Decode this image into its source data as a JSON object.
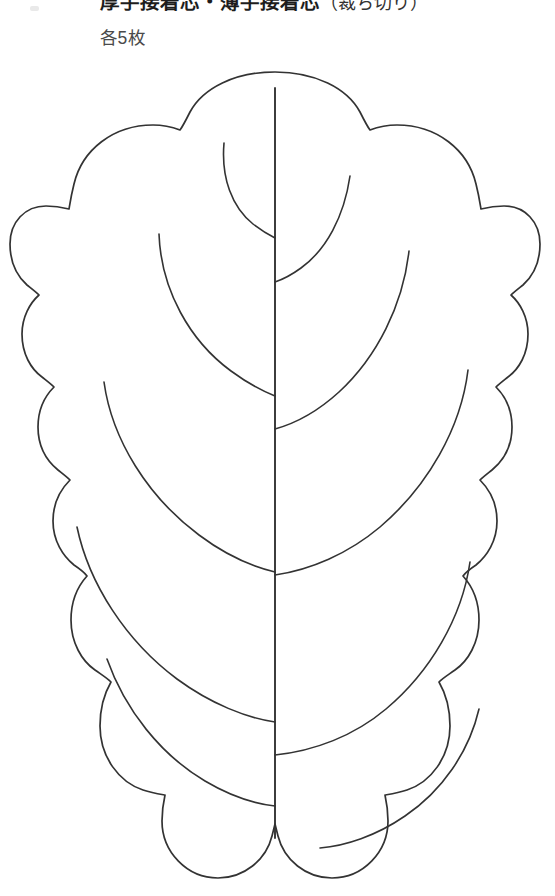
{
  "document": {
    "type": "sewing-pattern-template",
    "background_color": "#ffffff",
    "width": 555,
    "height": 896
  },
  "header": {
    "title_main": "厚手接着芯・薄手接着芯",
    "title_paren": "（裁ち切り）",
    "quantity": "各5枚",
    "title_color": "#1d1d1d",
    "quantity_color": "#4a4a4a"
  },
  "pattern": {
    "name": "scalloped-leaf-template",
    "stroke_color": "#333333",
    "fill_color": "#ffffff",
    "stroke_width": 1.7,
    "lobes_per_side": 6,
    "vein_pairs": 5,
    "midrib": {
      "x": 275,
      "y_top": 88,
      "y_bottom": 838
    },
    "bounds": {
      "left": 18,
      "right": 531,
      "top": 72,
      "bottom": 878
    }
  }
}
